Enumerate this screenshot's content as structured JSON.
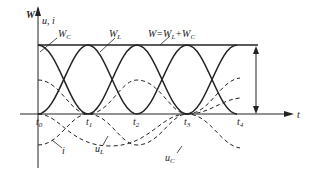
{
  "diagram": {
    "type": "waveform",
    "axes": {
      "vertical_label_W": "W",
      "vertical_label_ui": "u, i",
      "horizontal_label": "t"
    },
    "time_ticks": [
      {
        "label": "t",
        "sub": "0"
      },
      {
        "label": "t",
        "sub": "1"
      },
      {
        "label": "t",
        "sub": "2"
      },
      {
        "label": "t",
        "sub": "3"
      },
      {
        "label": "t",
        "sub": "4"
      }
    ],
    "curves": {
      "W_C": {
        "label": "W",
        "sub": "C",
        "style": "solid"
      },
      "W_L": {
        "label": "W",
        "sub": "L",
        "style": "solid"
      },
      "W_total": {
        "label": "W=W",
        "sub1": "L",
        "plus": "+W",
        "sub2": "C",
        "style": "solid-flat"
      },
      "i": {
        "label": "i",
        "style": "dashed"
      },
      "u_L": {
        "label": "u",
        "sub": "L",
        "style": "dashed"
      },
      "u_C": {
        "label": "u",
        "sub": "C",
        "style": "dashed"
      }
    },
    "colors": {
      "stroke": "#222222",
      "background": "#ffffff"
    }
  }
}
